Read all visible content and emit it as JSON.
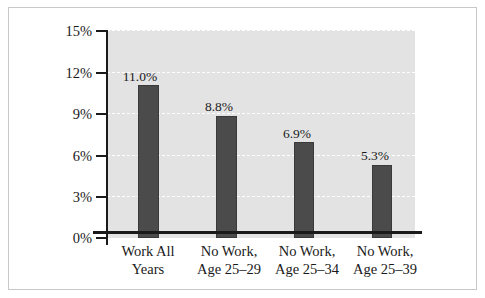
{
  "chart_data": {
    "type": "bar",
    "title": "",
    "subtitle": "",
    "xlabel": "",
    "ylabel": "",
    "categories": [
      "Work All Years",
      "No Work, Age 25–29",
      "No Work, Age 25–34",
      "No Work, Age 25–39"
    ],
    "category_lines": [
      [
        "Work All",
        "Years"
      ],
      [
        "No Work,",
        "Age 25–29"
      ],
      [
        "No Work,",
        "Age 25–34"
      ],
      [
        "No Work,",
        "Age 25–39"
      ]
    ],
    "values": [
      11.0,
      8.8,
      6.9,
      5.3
    ],
    "value_labels": [
      "11.0%",
      "8.8%",
      "6.9%",
      "5.3%"
    ],
    "ylim": [
      0,
      15
    ],
    "ytick_values": [
      0,
      3,
      6,
      9,
      12,
      15
    ],
    "ytick_labels": [
      "0%",
      "3%",
      "6%",
      "9%",
      "12%",
      "15%"
    ],
    "grid": true,
    "grid_style": "dashed",
    "legend": false,
    "legend_position": "none",
    "colors": {
      "bar_fill": "#4b4b4b",
      "bar_edge": "#3a3a3a",
      "plot_background": "#e3e3e3",
      "gridline": "#ffffff",
      "axis": "#1a1a1a",
      "figure_background": "#ffffff",
      "figure_border": "#c8c8c8",
      "text": "#1a1a1a"
    }
  }
}
